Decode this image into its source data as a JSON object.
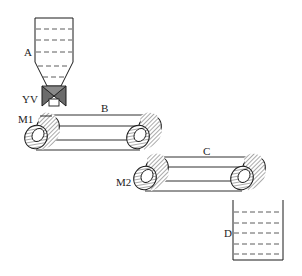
{
  "diagram": {
    "type": "process-schematic",
    "colors": {
      "stroke": "#1a1a1a",
      "valve_fill": "#6b6b6b",
      "hatch": "#555555",
      "background": "#ffffff"
    },
    "components": {
      "hopper": {
        "label": "A",
        "name": "Hopper"
      },
      "valve": {
        "label": "YV",
        "name": "Solenoid valve"
      },
      "conveyor_1": {
        "label": "B",
        "name": "Conveyor belt B",
        "motor_label": "M1"
      },
      "conveyor_2": {
        "label": "C",
        "name": "Conveyor belt C",
        "motor_label": "M2"
      },
      "container": {
        "label": "D",
        "name": "Receiving container"
      }
    }
  }
}
